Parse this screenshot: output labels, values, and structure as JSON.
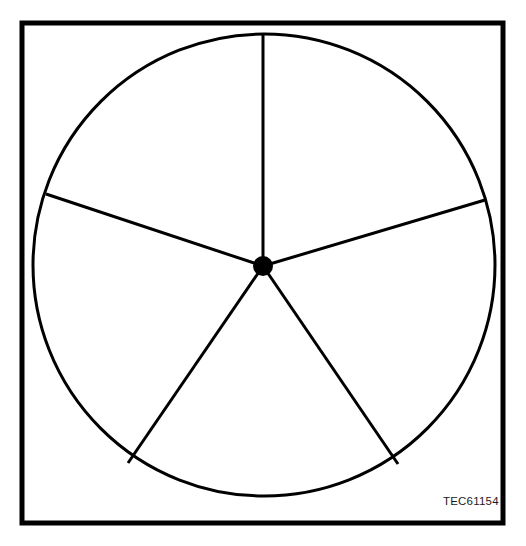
{
  "figure": {
    "title_fragment": "·  ·      ·       ·  ·   ·· ··",
    "caption_code": "TEC61154",
    "background_color": "#ffffff",
    "ink_color": "#000000"
  },
  "border": {
    "name": "outer-frame",
    "x": 22,
    "y": 23,
    "width": 481,
    "height": 500,
    "stroke_width": 5,
    "color": "#000000"
  },
  "chart_data": {
    "type": "diagram",
    "subtype": "five-spoke-wheel",
    "title": "",
    "xlabel": "",
    "ylabel": "",
    "grid": false,
    "legend": "none",
    "hub": {
      "label": "center-hub",
      "cx": 263,
      "cy": 266,
      "radius": 10,
      "fill": "#000000"
    },
    "rim": {
      "label": "outer-circle",
      "cx": 264,
      "cy": 265,
      "radius": 231,
      "stroke_width": 3,
      "fill": "none",
      "stroke": "#000000"
    },
    "spoke_count": 5,
    "spoke_stroke_width": 3,
    "spokes": [
      {
        "name": "spoke-top",
        "angle_deg": 90,
        "x1": 263,
        "y1": 266,
        "x2": 263,
        "y2": 34
      },
      {
        "name": "spoke-upper-right",
        "angle_deg": 18,
        "x1": 263,
        "y1": 266,
        "x2": 485,
        "y2": 200
      },
      {
        "name": "spoke-lower-right",
        "angle_deg": 306,
        "x1": 263,
        "y1": 266,
        "x2": 398,
        "y2": 464
      },
      {
        "name": "spoke-lower-left",
        "angle_deg": 234,
        "x1": 263,
        "y1": 266,
        "x2": 128,
        "y2": 463
      },
      {
        "name": "spoke-upper-left",
        "angle_deg": 162,
        "x1": 263,
        "y1": 266,
        "x2": 46,
        "y2": 194
      }
    ],
    "sector_count": 5,
    "sector_angle_deg": 72
  }
}
